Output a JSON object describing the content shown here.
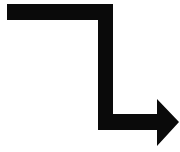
{
  "figure": {
    "color": "#0a0a0a",
    "background": "#ffffff",
    "icon": "elbow-arrow-down-right-icon"
  }
}
